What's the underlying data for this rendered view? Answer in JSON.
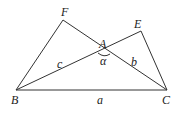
{
  "diagram": {
    "type": "geometry-triangles",
    "stroke_color": "#333333",
    "label_color": "#222222",
    "points": {
      "F": {
        "label": "F",
        "x": 63,
        "y": 20
      },
      "E": {
        "label": "E",
        "x": 141,
        "y": 31
      },
      "A": {
        "label": "A",
        "x": 104,
        "y": 50
      },
      "B": {
        "label": "B",
        "x": 16,
        "y": 90
      },
      "C": {
        "label": "C",
        "x": 167,
        "y": 90
      }
    },
    "segments": [
      {
        "from": "B",
        "to": "C"
      },
      {
        "from": "B",
        "to": "F"
      },
      {
        "from": "F",
        "to": "C"
      },
      {
        "from": "B",
        "to": "E"
      },
      {
        "from": "E",
        "to": "C"
      }
    ],
    "side_labels": {
      "a": "a",
      "b": "b",
      "c": "c"
    },
    "angle_label": "α"
  }
}
